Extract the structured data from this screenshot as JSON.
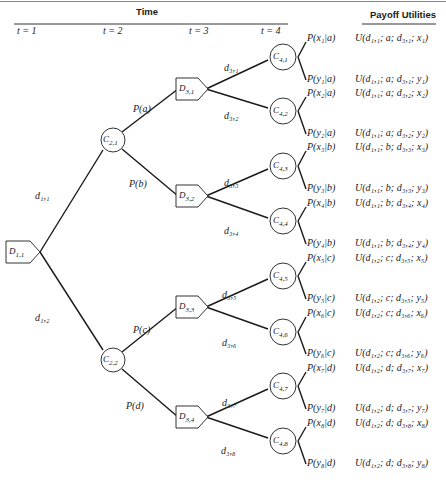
{
  "header": {
    "time_label": "Time",
    "payoff_label": "Payoff Utilities",
    "time_steps": [
      "t = 1",
      "t = 2",
      "t = 3",
      "t = 4"
    ]
  },
  "nodes": {
    "decision": [
      {
        "id": "D1,1",
        "label": "D",
        "sub": "1,1",
        "x": 18,
        "y": 252
      },
      {
        "id": "D3,1",
        "label": "D",
        "sub": "3,1",
        "x": 188,
        "y": 89
      },
      {
        "id": "D3,2",
        "label": "D",
        "sub": "3,2",
        "x": 188,
        "y": 196
      },
      {
        "id": "D3,3",
        "label": "D",
        "sub": "3,3",
        "x": 188,
        "y": 307
      },
      {
        "id": "D3,4",
        "label": "D",
        "sub": "3,4",
        "x": 188,
        "y": 417
      }
    ],
    "chance": [
      {
        "id": "C2,1",
        "label": "C",
        "sub": "2,1",
        "x": 113,
        "y": 140
      },
      {
        "id": "C2,2",
        "label": "C",
        "sub": "2,2",
        "x": 113,
        "y": 360
      },
      {
        "id": "C4,1",
        "label": "C",
        "sub": "4,1",
        "x": 283,
        "y": 57
      },
      {
        "id": "C4,2",
        "label": "C",
        "sub": "4,2",
        "x": 283,
        "y": 111
      },
      {
        "id": "C4,3",
        "label": "C",
        "sub": "4,3",
        "x": 283,
        "y": 166
      },
      {
        "id": "C4,4",
        "label": "C",
        "sub": "4,4",
        "x": 283,
        "y": 221
      },
      {
        "id": "C4,5",
        "label": "C",
        "sub": "4,5",
        "x": 283,
        "y": 276
      },
      {
        "id": "C4,6",
        "label": "C",
        "sub": "4,6",
        "x": 283,
        "y": 332
      },
      {
        "id": "C4,7",
        "label": "C",
        "sub": "4,7",
        "x": 283,
        "y": 386
      },
      {
        "id": "C4,8",
        "label": "C",
        "sub": "4,8",
        "x": 283,
        "y": 441
      }
    ]
  },
  "branch_labels": [
    {
      "text": "d₁,₁",
      "x": 35,
      "y": 190
    },
    {
      "text": "d₁,₂",
      "x": 35,
      "y": 312
    },
    {
      "text": "P(a)",
      "x": 133,
      "y": 103
    },
    {
      "text": "P(b)",
      "x": 129,
      "y": 178
    },
    {
      "text": "P(c)",
      "x": 133,
      "y": 324
    },
    {
      "text": "P(d)",
      "x": 126,
      "y": 400
    },
    {
      "text": "d₃,₁",
      "x": 224,
      "y": 62
    },
    {
      "text": "d₃,₂",
      "x": 224,
      "y": 110
    },
    {
      "text": "d₃,₃",
      "x": 224,
      "y": 177
    },
    {
      "text": "d₃,₄",
      "x": 224,
      "y": 225
    },
    {
      "text": "d₃,₅",
      "x": 222,
      "y": 289
    },
    {
      "text": "d₃,₆",
      "x": 222,
      "y": 337
    },
    {
      "text": "d₃,₇",
      "x": 222,
      "y": 397
    },
    {
      "text": "d₃,₈",
      "x": 221,
      "y": 445
    }
  ],
  "outcomes": [
    {
      "prob": "P(x₁|a)",
      "utility": "U(d₁,₁; a; d₃,₁; x₁)",
      "y": 38
    },
    {
      "prob": "P(y₁|a)",
      "utility": "U(d₁,₁; a; d₃,₁; y₁)",
      "y": 79
    },
    {
      "prob": "P(x₂|a)",
      "utility": "U(d₁,₁; a; d₃,₂; x₂)",
      "y": 93
    },
    {
      "prob": "P(y₂|a)",
      "utility": "U(d₁,₁; a; d₃,₂; y₂)",
      "y": 133
    },
    {
      "prob": "P(x₃|b)",
      "utility": "U(d₁,₁; b; d₃,₃; x₃)",
      "y": 147
    },
    {
      "prob": "P(y₃|b)",
      "utility": "U(d₁,₁; b; d₃,₃; y₃)",
      "y": 188
    },
    {
      "prob": "P(x₄|b)",
      "utility": "U(d₁,₁; b; d₃,₄; x₄)",
      "y": 203
    },
    {
      "prob": "P(y₄|b)",
      "utility": "U(d₁,₁; b; d₃,₄; y₄)",
      "y": 243
    },
    {
      "prob": "P(x₅|c)",
      "utility": "U(d₁,₂; c; d₃,₅; x₅)",
      "y": 258
    },
    {
      "prob": "P(y₅|c)",
      "utility": "U(d₁,₂; c; d₃,₅; y₅)",
      "y": 298
    },
    {
      "prob": "P(x₆|c)",
      "utility": "U(d₁,₂; c; d₃,₆; x₆)",
      "y": 313
    },
    {
      "prob": "P(y₆|c)",
      "utility": "U(d₁,₂; c; d₃,₆; y₆)",
      "y": 353
    },
    {
      "prob": "P(x₇|d)",
      "utility": "U(d₁,₂; d; d₃,₇; x₇)",
      "y": 368
    },
    {
      "prob": "P(y₇|d)",
      "utility": "U(d₁,₂; d; d₃,₇; y₇)",
      "y": 408
    },
    {
      "prob": "P(x₈|d)",
      "utility": "U(d₁,₂; d; d₃,₈; x₈)",
      "y": 423
    },
    {
      "prob": "P(y₈|d)",
      "utility": "U(d₁,₂; d; d₃,₈; y₈)",
      "y": 463
    }
  ]
}
